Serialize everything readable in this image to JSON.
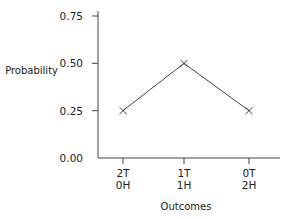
{
  "chart_data": {
    "type": "line",
    "title": "",
    "xlabel": "Outcomes",
    "ylabel": "Probability",
    "categories": [
      "2T 0H",
      "1T 1H",
      "0T 2H"
    ],
    "category_lines": [
      [
        "2T",
        "0H"
      ],
      [
        "1T",
        "1H"
      ],
      [
        "0T",
        "2H"
      ]
    ],
    "values": [
      0.25,
      0.5,
      0.25
    ],
    "marker": "x",
    "ylim": [
      0,
      0.75
    ],
    "yticks": [
      "0.00",
      "0.25",
      "0.50",
      "0.75"
    ],
    "grid": false,
    "legend": null,
    "line_color": "#444444"
  }
}
